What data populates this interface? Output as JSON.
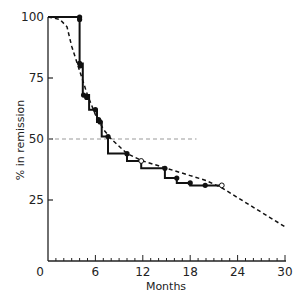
{
  "chart_data": {
    "type": "line",
    "title": "",
    "xlabel": "Months",
    "ylabel": "% in remission",
    "xlim": [
      0,
      30
    ],
    "ylim": [
      0,
      100
    ],
    "x_ticks": [
      0,
      6,
      12,
      18,
      24,
      30
    ],
    "y_ticks": [
      25,
      50,
      75,
      100
    ],
    "grid": false,
    "reference_line": {
      "y": 50,
      "style": "dashed"
    },
    "series": [
      {
        "name": "observed (step)",
        "style": "solid-step",
        "points": [
          [
            0,
            100
          ],
          [
            4,
            100
          ],
          [
            4,
            81
          ],
          [
            4.4,
            81
          ],
          [
            4.4,
            68
          ],
          [
            5.2,
            68
          ],
          [
            5.2,
            62
          ],
          [
            6.2,
            62
          ],
          [
            6.2,
            57
          ],
          [
            6.8,
            57
          ],
          [
            6.8,
            51
          ],
          [
            7.6,
            51
          ],
          [
            7.6,
            44
          ],
          [
            10,
            44
          ],
          [
            10,
            41
          ],
          [
            11.8,
            41
          ],
          [
            11.8,
            38
          ],
          [
            14.8,
            38
          ],
          [
            14.8,
            34
          ],
          [
            16.3,
            34
          ],
          [
            16.3,
            32
          ],
          [
            18,
            32
          ],
          [
            18,
            31
          ],
          [
            22,
            31
          ]
        ],
        "event_markers": [
          [
            4,
            100
          ],
          [
            4,
            99
          ],
          [
            4,
            81
          ],
          [
            4.1,
            80
          ],
          [
            4.5,
            68
          ],
          [
            4.9,
            67
          ],
          [
            6,
            62
          ],
          [
            6.4,
            58
          ],
          [
            6.6,
            57
          ],
          [
            7.6,
            51
          ],
          [
            10,
            44
          ],
          [
            14.8,
            38
          ],
          [
            16.3,
            34
          ],
          [
            18,
            32
          ],
          [
            19.9,
            31
          ]
        ],
        "censored_markers": [
          [
            11.8,
            41
          ],
          [
            22,
            31
          ]
        ]
      },
      {
        "name": "fitted (dashed)",
        "style": "dashed",
        "points": [
          [
            0,
            100
          ],
          [
            1.5,
            99
          ],
          [
            2.4,
            96
          ],
          [
            3,
            88
          ],
          [
            4,
            78
          ],
          [
            5,
            68
          ],
          [
            6,
            60
          ],
          [
            7,
            54
          ],
          [
            8,
            50
          ],
          [
            9,
            47
          ],
          [
            10,
            44
          ],
          [
            12,
            41
          ],
          [
            14,
            39
          ],
          [
            16,
            37
          ],
          [
            18,
            35
          ],
          [
            20,
            33
          ],
          [
            22,
            30
          ],
          [
            24,
            26
          ],
          [
            26,
            22
          ],
          [
            28,
            18
          ],
          [
            30,
            14
          ]
        ]
      }
    ]
  },
  "labels": {
    "x_ticks": [
      "0",
      "6",
      "12",
      "18",
      "24",
      "30"
    ],
    "y_ticks": [
      "25",
      "50",
      "75",
      "100"
    ],
    "xlabel": "Months",
    "ylabel": "% in remission"
  },
  "caption": "Fig. … Kaplan–Meier remission curve …"
}
